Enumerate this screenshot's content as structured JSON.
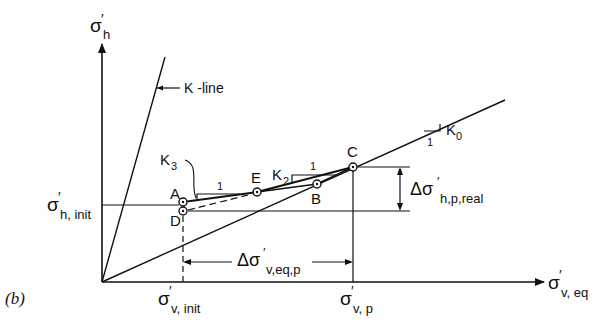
{
  "figure": {
    "panel_label": "(b)",
    "axes": {
      "y_label": {
        "symbol": "σ",
        "prime": "′",
        "sub": "h"
      },
      "x_label": {
        "symbol": "σ",
        "prime": "′",
        "sub": "v, eq"
      }
    },
    "tick_labels": {
      "y_init": {
        "symbol": "σ",
        "prime": "′",
        "sub": "h, init"
      },
      "x_init": {
        "symbol": "σ",
        "prime": "′",
        "sub": "v, init"
      },
      "x_p": {
        "symbol": "σ",
        "prime": "′",
        "sub": "v, p"
      }
    },
    "lines": {
      "k_line_label": "K -line",
      "k0_label": "K",
      "k0_sub": "0",
      "k2_label": "K",
      "k2_sub": "2",
      "k3_label": "K",
      "k3_sub": "3",
      "slope_run": "1"
    },
    "points": [
      "A",
      "B",
      "C",
      "D",
      "E"
    ],
    "dimensions": {
      "delta_v": {
        "symbol": "Δσ",
        "prime": "′",
        "sub": "v,eq,p"
      },
      "delta_h": {
        "symbol": "Δσ",
        "prime": "′",
        "sub": "h,p,real"
      }
    },
    "colors": {
      "ink": "#111111",
      "background": "#ffffff"
    }
  }
}
